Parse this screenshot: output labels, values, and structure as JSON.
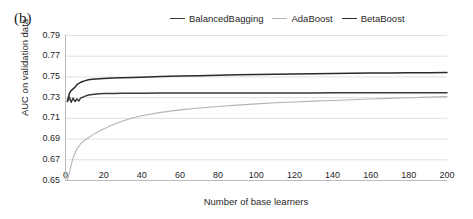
{
  "panel": {
    "label": "(b)"
  },
  "legend": {
    "position": "top-center",
    "items": [
      {
        "label": "BalancedBagging",
        "color": "#3a3a3a"
      },
      {
        "label": "AdaBoost",
        "color": "#b4b4b4"
      },
      {
        "label": "BetaBoost",
        "color": "#2b2b2b"
      }
    ]
  },
  "axes": {
    "xlabel": "Number of base learners",
    "ylabel": "AUC on validation data",
    "xticks": [
      "0",
      "20",
      "40",
      "60",
      "80",
      "100",
      "120",
      "140",
      "160",
      "180",
      "200"
    ],
    "yticks": [
      "0.65",
      "0.67",
      "0.69",
      "0.71",
      "0.73",
      "0.75",
      "0.77",
      "0.79"
    ]
  },
  "chart_data": {
    "type": "line",
    "title": "(b)",
    "xlabel": "Number of base learners",
    "ylabel": "AUC on validation data",
    "xlim": [
      0,
      200
    ],
    "ylim": [
      0.65,
      0.79
    ],
    "xticks": [
      0,
      20,
      40,
      60,
      80,
      100,
      120,
      140,
      160,
      180,
      200
    ],
    "yticks": [
      0.65,
      0.67,
      0.69,
      0.71,
      0.73,
      0.75,
      0.77,
      0.79
    ],
    "grid": "horizontal",
    "legend_position": "top-center",
    "series": [
      {
        "name": "BalancedBagging",
        "color": "#3a3a3a",
        "x": [
          1,
          2,
          3,
          4,
          5,
          6,
          7,
          8,
          9,
          10,
          12,
          14,
          16,
          18,
          20,
          25,
          30,
          40,
          50,
          60,
          70,
          80,
          90,
          100,
          110,
          120,
          130,
          140,
          150,
          160,
          170,
          180,
          190,
          200
        ],
        "y": [
          0.7265,
          0.7305,
          0.7255,
          0.7295,
          0.7262,
          0.7288,
          0.7268,
          0.7298,
          0.7304,
          0.7312,
          0.7326,
          0.7331,
          0.7335,
          0.7337,
          0.7339,
          0.7341,
          0.7342,
          0.7343,
          0.7344,
          0.7344,
          0.7345,
          0.7345,
          0.7345,
          0.7346,
          0.7346,
          0.7346,
          0.7346,
          0.7347,
          0.7347,
          0.7347,
          0.7347,
          0.7347,
          0.7347,
          0.7347
        ]
      },
      {
        "name": "AdaBoost",
        "color": "#b4b4b4",
        "x": [
          1,
          2,
          3,
          4,
          5,
          6,
          7,
          8,
          9,
          10,
          12,
          14,
          16,
          18,
          20,
          25,
          30,
          35,
          40,
          50,
          60,
          70,
          80,
          90,
          100,
          110,
          120,
          130,
          140,
          150,
          160,
          170,
          180,
          190,
          200
        ],
        "y": [
          0.65,
          0.657,
          0.665,
          0.6718,
          0.6768,
          0.6805,
          0.6832,
          0.6855,
          0.6872,
          0.6888,
          0.6913,
          0.6938,
          0.696,
          0.698,
          0.6998,
          0.704,
          0.7075,
          0.7103,
          0.7125,
          0.7158,
          0.7182,
          0.72,
          0.7215,
          0.7228,
          0.724,
          0.725,
          0.7258,
          0.7266,
          0.7273,
          0.728,
          0.7287,
          0.7293,
          0.7299,
          0.7305,
          0.731
        ]
      },
      {
        "name": "BetaBoost",
        "color": "#2b2b2b",
        "x": [
          1,
          2,
          3,
          4,
          5,
          6,
          7,
          8,
          9,
          10,
          12,
          14,
          16,
          18,
          20,
          25,
          30,
          40,
          50,
          60,
          70,
          80,
          90,
          100,
          110,
          120,
          130,
          140,
          150,
          160,
          170,
          180,
          190,
          200
        ],
        "y": [
          0.7262,
          0.734,
          0.7368,
          0.7385,
          0.7402,
          0.7425,
          0.7438,
          0.7448,
          0.7456,
          0.7462,
          0.7472,
          0.7478,
          0.7481,
          0.7483,
          0.7485,
          0.7489,
          0.7492,
          0.7498,
          0.7503,
          0.7508,
          0.7512,
          0.7516,
          0.752,
          0.7523,
          0.7526,
          0.7529,
          0.7531,
          0.7533,
          0.7535,
          0.7537,
          0.7538,
          0.754,
          0.7541,
          0.7542
        ]
      }
    ]
  }
}
